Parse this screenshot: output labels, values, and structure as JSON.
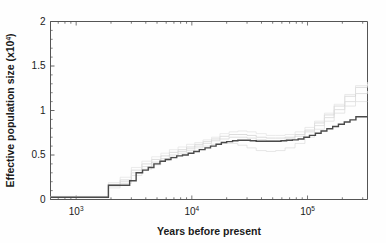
{
  "figure": {
    "name": "psmc-effective-population-size-plot",
    "background": "#fefefe",
    "main_line_color": "#4a4a4a",
    "ci_line_color": "#cfcfcf",
    "axis_color": "#555555"
  },
  "chart_data": {
    "type": "line",
    "title": "",
    "xlabel": "Years before present",
    "ylabel": "Effective population size (x10⁴)",
    "xscale": "log",
    "yscale": "linear",
    "xlim": [
      600,
      330000
    ],
    "ylim": [
      0,
      2
    ],
    "grid": false,
    "legend": null,
    "yticks": [
      0,
      0.5,
      1,
      1.5,
      2
    ],
    "ytick_labels": [
      "0",
      "0.5",
      "1",
      "1.5",
      "2"
    ],
    "xticks": [
      1000,
      10000,
      100000
    ],
    "xtick_labels": [
      "10³",
      "10⁴",
      "10⁵"
    ],
    "xtick_label_parts": [
      {
        "base": "10",
        "exp": "3"
      },
      {
        "base": "10",
        "exp": "4"
      },
      {
        "base": "10",
        "exp": "5"
      }
    ],
    "series": [
      {
        "name": "PSMC estimate (bootstrap replicate 1)",
        "style": "step",
        "color": "#cfcfcf",
        "width": 0.7,
        "x": [
          600,
          1500,
          1900,
          2400,
          3000,
          3700,
          4500,
          5400,
          6400,
          7600,
          9000,
          10600,
          12500,
          14800,
          17500,
          21000,
          25000,
          30000,
          36000,
          44000,
          53000,
          64000,
          78000,
          95000,
          115000,
          140000,
          170000,
          210000,
          260000,
          330000
        ],
        "y": [
          0.03,
          0.03,
          0.17,
          0.22,
          0.33,
          0.4,
          0.45,
          0.49,
          0.53,
          0.56,
          0.59,
          0.62,
          0.65,
          0.68,
          0.71,
          0.73,
          0.73,
          0.72,
          0.7,
          0.69,
          0.69,
          0.7,
          0.73,
          0.78,
          0.86,
          0.95,
          1.05,
          1.16,
          1.26,
          1.32
        ]
      },
      {
        "name": "PSMC estimate (bootstrap replicate 2)",
        "style": "step",
        "color": "#d4d4d4",
        "width": 0.7,
        "x": [
          600,
          1500,
          1900,
          2400,
          3000,
          3700,
          4500,
          5400,
          6400,
          7600,
          9000,
          10600,
          12500,
          14800,
          17500,
          21000,
          25000,
          30000,
          36000,
          44000,
          53000,
          64000,
          78000,
          95000,
          115000,
          140000,
          170000,
          210000,
          260000,
          330000
        ],
        "y": [
          0.025,
          0.025,
          0.15,
          0.2,
          0.3,
          0.37,
          0.42,
          0.46,
          0.5,
          0.54,
          0.57,
          0.6,
          0.63,
          0.66,
          0.68,
          0.7,
          0.7,
          0.69,
          0.67,
          0.66,
          0.66,
          0.68,
          0.71,
          0.76,
          0.83,
          0.92,
          1.01,
          1.1,
          1.19,
          1.22
        ]
      },
      {
        "name": "PSMC estimate (bootstrap replicate 3)",
        "style": "step",
        "color": "#dcdcdc",
        "width": 0.7,
        "x": [
          600,
          1500,
          1900,
          2400,
          3000,
          3700,
          4500,
          5400,
          6400,
          7600,
          9000,
          10600,
          12500,
          14800,
          17500,
          21000,
          25000,
          30000,
          36000,
          44000,
          53000,
          64000,
          78000,
          95000,
          115000,
          140000,
          170000,
          210000,
          260000,
          330000
        ],
        "y": [
          0.02,
          0.02,
          0.13,
          0.18,
          0.27,
          0.34,
          0.39,
          0.44,
          0.48,
          0.52,
          0.55,
          0.58,
          0.6,
          0.62,
          0.63,
          0.63,
          0.61,
          0.58,
          0.55,
          0.54,
          0.55,
          0.58,
          0.63,
          0.7,
          0.79,
          0.88,
          0.97,
          1.05,
          1.1,
          1.1
        ]
      },
      {
        "name": "PSMC estimate (bootstrap replicate 4)",
        "style": "step",
        "color": "#e2e2e2",
        "width": 0.7,
        "x": [
          600,
          1500,
          1900,
          2400,
          3000,
          3700,
          4500,
          5400,
          6400,
          7600,
          9000,
          10600,
          12500,
          14800,
          17500,
          21000,
          25000,
          30000,
          36000,
          44000,
          53000,
          64000,
          78000,
          95000,
          115000,
          140000,
          170000,
          210000,
          260000,
          330000
        ],
        "y": [
          0.035,
          0.035,
          0.19,
          0.25,
          0.36,
          0.43,
          0.48,
          0.52,
          0.56,
          0.59,
          0.62,
          0.64,
          0.67,
          0.7,
          0.74,
          0.76,
          0.77,
          0.76,
          0.74,
          0.72,
          0.72,
          0.73,
          0.76,
          0.81,
          0.88,
          0.97,
          1.07,
          1.18,
          1.28,
          1.3
        ]
      },
      {
        "name": "PSMC estimate (main)",
        "style": "step",
        "color": "#4a4a4a",
        "width": 1.4,
        "x": [
          600,
          1550,
          1900,
          2450,
          2900,
          3300,
          3750,
          4200,
          4700,
          5300,
          5900,
          6600,
          7400,
          8300,
          9300,
          10400,
          11600,
          13000,
          14500,
          16200,
          18000,
          20000,
          22500,
          25000,
          28000,
          32000,
          36000,
          41000,
          46000,
          52000,
          59000,
          66000,
          74000,
          83000,
          93000,
          104000,
          117000,
          131000,
          147000,
          165000,
          185000,
          208000,
          233000,
          262000,
          330000
        ],
        "y": [
          0.025,
          0.025,
          0.16,
          0.16,
          0.21,
          0.3,
          0.33,
          0.36,
          0.4,
          0.43,
          0.45,
          0.47,
          0.49,
          0.5,
          0.52,
          0.54,
          0.56,
          0.58,
          0.6,
          0.62,
          0.64,
          0.65,
          0.66,
          0.665,
          0.665,
          0.66,
          0.655,
          0.655,
          0.655,
          0.655,
          0.66,
          0.665,
          0.67,
          0.68,
          0.7,
          0.72,
          0.745,
          0.77,
          0.795,
          0.82,
          0.845,
          0.87,
          0.895,
          0.93,
          0.93
        ]
      }
    ]
  }
}
